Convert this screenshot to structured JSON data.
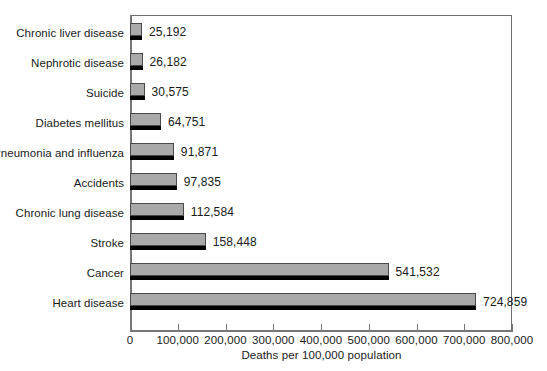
{
  "chart_data": {
    "type": "bar",
    "orientation": "horizontal",
    "title": "",
    "xlabel": "Deaths per 100,000 population",
    "ylabel": "",
    "xlim": [
      0,
      800000
    ],
    "grid": false,
    "legend": null,
    "xticks": [
      "0",
      "100,000",
      "200,000",
      "300,000",
      "400,000",
      "500,000",
      "600,000",
      "700,000",
      "800,000"
    ],
    "xtick_values": [
      0,
      100000,
      200000,
      300000,
      400000,
      500000,
      600000,
      700000,
      800000
    ],
    "categories": [
      "Chronic liver disease",
      "Nephrotic disease",
      "Suicide",
      "Diabetes mellitus",
      "Pneumonia and influenza",
      "Accidents",
      "Chronic lung disease",
      "Stroke",
      "Cancer",
      "Heart disease"
    ],
    "values": [
      25192,
      26182,
      30575,
      64751,
      91871,
      97835,
      112584,
      158448,
      541532,
      724859
    ],
    "value_labels": [
      "25,192",
      "26,182",
      "30,575",
      "64,751",
      "91,871",
      "97,835",
      "112,584",
      "158,448",
      "541,532",
      "724,859"
    ],
    "colors": {
      "bar_fill": "#a9a9a9",
      "bar_outline": "#4a4a4a",
      "bar_shadow": "#000000",
      "axis": "#767676",
      "frame": "#6e6e6e",
      "text": "#1a1a1a",
      "background": "#ffffff"
    }
  }
}
